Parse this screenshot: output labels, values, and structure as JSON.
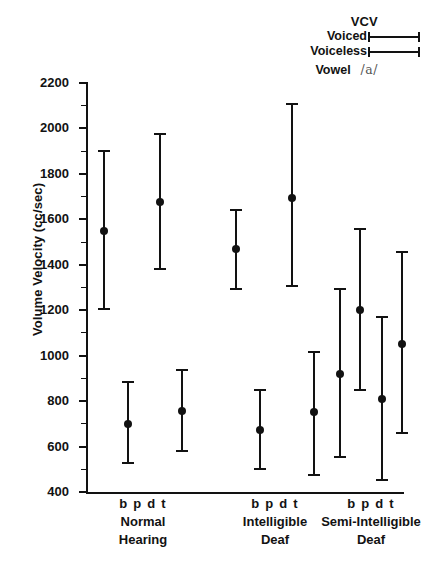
{
  "legend": {
    "title": "VCV",
    "entries": [
      {
        "label": "Voiced",
        "marker": "error-bar-line"
      },
      {
        "label": "Voiceless",
        "marker": "error-bar-line"
      }
    ],
    "vowel_label": "Vowel",
    "vowel_value": "/a/"
  },
  "axes": {
    "ylabel": "Volume Velocity (cc/sec)",
    "yticks": [
      "400",
      "600",
      "800",
      "1000",
      "1200",
      "1400",
      "1600",
      "1800",
      "2000",
      "2200"
    ]
  },
  "groups": [
    {
      "name_line1": "Normal",
      "name_line2": "Hearing",
      "pairs": "b p   d t"
    },
    {
      "name_line1": "Intelligible",
      "name_line2": "Deaf",
      "pairs": "b p   d t"
    },
    {
      "name_line1": "Semi-Intelligible",
      "name_line2": "Deaf",
      "pairs": "b p   d t"
    }
  ],
  "chart_data": {
    "type": "scatter",
    "title": "",
    "xlabel": "",
    "ylabel": "Volume Velocity (cc/sec)",
    "ylim": [
      400,
      2200
    ],
    "ytick_step": 200,
    "grid": false,
    "legend_position": "top-right",
    "legend_title": "VCV",
    "vowel": "/a/",
    "groups": [
      "Normal Hearing",
      "Intelligible Deaf",
      "Semi-Intelligible Deaf"
    ],
    "consonant_pairs": [
      "b p",
      "d t"
    ],
    "series": [
      {
        "name": "Voiced",
        "note": "b and d"
      },
      {
        "name": "Voiceless",
        "note": "p and t"
      }
    ],
    "points": [
      {
        "group": "Normal Hearing",
        "pair": "b p",
        "voicing": "Voiced",
        "consonant": "b",
        "mean": 1550,
        "low": 1200,
        "high": 1905
      },
      {
        "group": "Normal Hearing",
        "pair": "b p",
        "voicing": "Voiceless",
        "consonant": "p",
        "mean": 700,
        "low": 525,
        "high": 890
      },
      {
        "group": "Normal Hearing",
        "pair": "d t",
        "voicing": "Voiced",
        "consonant": "d",
        "mean": 1675,
        "low": 1375,
        "high": 1980
      },
      {
        "group": "Normal Hearing",
        "pair": "d t",
        "voicing": "Voiceless",
        "consonant": "t",
        "mean": 755,
        "low": 575,
        "high": 940
      },
      {
        "group": "Intelligible Deaf",
        "pair": "b p",
        "voicing": "Voiced",
        "consonant": "b",
        "mean": 1470,
        "low": 1290,
        "high": 1645
      },
      {
        "group": "Intelligible Deaf",
        "pair": "b p",
        "voicing": "Voiceless",
        "consonant": "p",
        "mean": 675,
        "low": 495,
        "high": 855
      },
      {
        "group": "Intelligible Deaf",
        "pair": "d t",
        "voicing": "Voiced",
        "consonant": "d",
        "mean": 1695,
        "low": 1300,
        "high": 2110
      },
      {
        "group": "Intelligible Deaf",
        "pair": "d t",
        "voicing": "Voiceless",
        "consonant": "t",
        "mean": 750,
        "low": 470,
        "high": 1020
      },
      {
        "group": "Semi-Intelligible Deaf",
        "pair": "b p",
        "voicing": "Voiced",
        "consonant": "b",
        "mean": 920,
        "low": 550,
        "high": 1300
      },
      {
        "group": "Semi-Intelligible Deaf",
        "pair": "b p",
        "voicing": "Voiceless",
        "consonant": "p",
        "mean": 1200,
        "low": 845,
        "high": 1560
      },
      {
        "group": "Semi-Intelligible Deaf",
        "pair": "d t",
        "voicing": "Voiced",
        "consonant": "d",
        "mean": 810,
        "low": 450,
        "high": 1175
      },
      {
        "group": "Semi-Intelligible Deaf",
        "pair": "d t",
        "voicing": "Voiceless",
        "consonant": "t",
        "mean": 1050,
        "low": 655,
        "high": 1460
      }
    ],
    "x_positions": [
      18,
      42,
      74,
      96,
      150,
      174,
      206,
      228,
      254,
      274,
      296,
      316
    ]
  }
}
